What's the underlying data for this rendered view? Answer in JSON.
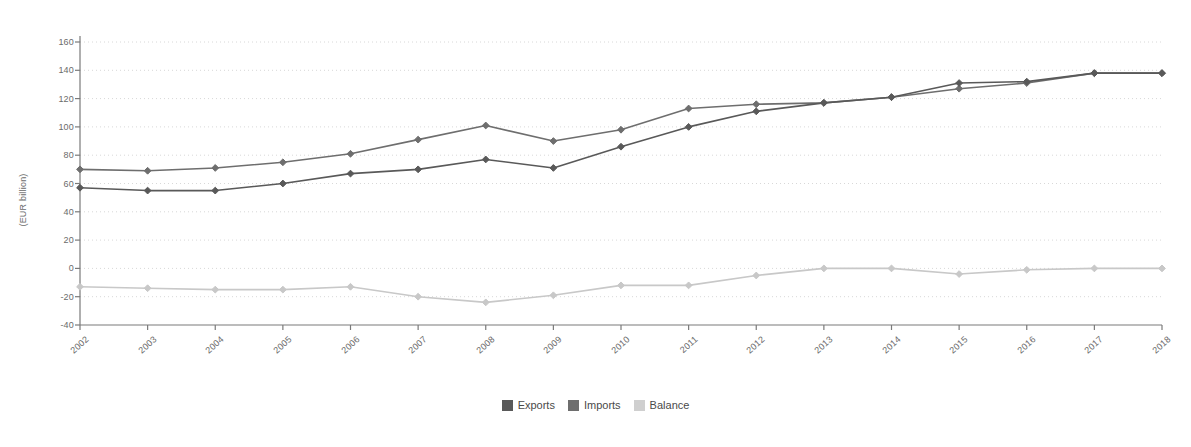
{
  "chart_data": {
    "type": "line",
    "title": "",
    "xlabel": "",
    "ylabel": "(EUR billion)",
    "categories": [
      "2002",
      "2003",
      "2004",
      "2005",
      "2006",
      "2007",
      "2008",
      "2009",
      "2010",
      "2011",
      "2012",
      "2013",
      "2014",
      "2015",
      "2016",
      "2017",
      "2018"
    ],
    "ylim": [
      -40,
      160
    ],
    "ytick_values": [
      -40,
      -20,
      0,
      20,
      40,
      60,
      80,
      100,
      120,
      140,
      160
    ],
    "ytick_labels": [
      "-40",
      "-20",
      "0",
      "20",
      "40",
      "60",
      "80",
      "100",
      "120",
      "140",
      "160"
    ],
    "grid": true,
    "grid_style": "dotted-horizontal",
    "legend_position": "bottom-center",
    "series": [
      {
        "name": "Exports",
        "color": "#595959",
        "values": [
          57,
          55,
          55,
          60,
          67,
          70,
          77,
          71,
          86,
          100,
          111,
          117,
          121,
          131,
          132,
          138,
          138
        ]
      },
      {
        "name": "Imports",
        "color": "#6e6e6e",
        "values": [
          70,
          69,
          71,
          75,
          81,
          91,
          101,
          90,
          98,
          113,
          116,
          117,
          121,
          127,
          131,
          138,
          138
        ]
      },
      {
        "name": "Balance",
        "color": "#c8c8c8",
        "values": [
          -13,
          -14,
          -15,
          -15,
          -13,
          -20,
          -24,
          -19,
          -12,
          -12,
          -5,
          0,
          0,
          -4,
          -1,
          0,
          0
        ]
      }
    ]
  },
  "legend": {
    "items": [
      {
        "label": "Exports",
        "color": "#595959"
      },
      {
        "label": "Imports",
        "color": "#6e6e6e"
      },
      {
        "label": "Balance",
        "color": "#cfcfcf"
      }
    ]
  },
  "colors": {
    "background": "#ffffff",
    "axis": "#7a7a7a",
    "grid": "#d8d8d8",
    "text": "#6b6b6b"
  }
}
